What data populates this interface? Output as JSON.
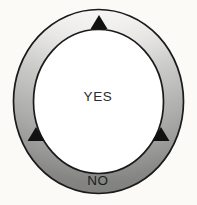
{
  "diagram": {
    "type": "annulus-decision-ring",
    "background_color": "#fbfaf7",
    "ring": {
      "name": "decision-ring",
      "outline_color": "#1a1a1a",
      "outline_width": 1.6,
      "fill_top_color": "#f2f1ee",
      "fill_mid_color": "#b8b8b8",
      "fill_bottom_color": "#8e8e8e",
      "center_x": 98.5,
      "center_y": 101.5,
      "outer_radius_x": 85,
      "outer_radius_y": 92,
      "inner_radius_x": 65,
      "inner_radius_y": 72
    },
    "center_area": {
      "name": "inner-disc",
      "fill_color": "#ffffff"
    },
    "labels": {
      "inner_label": "YES",
      "outer_label": "NO",
      "inner_label_x": 98,
      "inner_label_y": 101,
      "outer_label_x": 98,
      "outer_label_y": 185
    },
    "markers": {
      "color": "#111111",
      "shape": "triangle-up",
      "items": [
        {
          "name": "marker-top",
          "angle_deg": 90,
          "x": 99,
          "y": 22,
          "width": 17,
          "height": 14
        },
        {
          "name": "marker-lower-left",
          "angle_deg": 210,
          "x": 36,
          "y": 134,
          "width": 17,
          "height": 14
        },
        {
          "name": "marker-lower-right",
          "angle_deg": 330,
          "x": 161,
          "y": 134,
          "width": 17,
          "height": 14
        }
      ]
    }
  }
}
